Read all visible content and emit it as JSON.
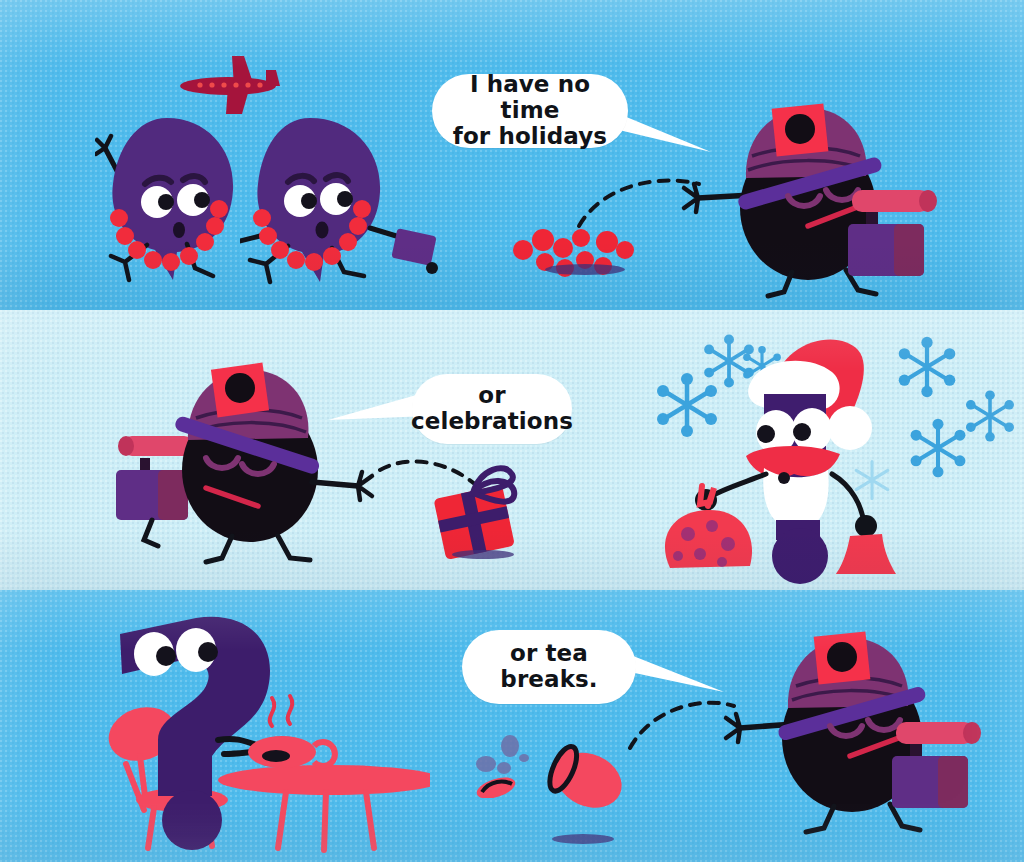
{
  "image": {
    "kind": "childrens-book-illustration",
    "title": "Grumpy traveller comic strip",
    "width": 1024,
    "height": 862,
    "panel_count": 3
  },
  "palette": {
    "sky_blue": "#4fbbec",
    "pale_blue": "#cdeef7",
    "purple": "#512a7e",
    "deep_purple": "#3d1d6b",
    "black_body": "#120d15",
    "red": "#ef2636",
    "pink_red": "#f4485f",
    "magenta_hat": "#7e3372",
    "violet_brim": "#5b2f9a",
    "white": "#ffffff",
    "snow_blue": "#3ba3dd"
  },
  "panels": [
    {
      "id": "panel-1",
      "name": "holidays",
      "background": "#4fbbec",
      "bubble": {
        "lines": [
          "I have no time",
          "for holidays"
        ],
        "tail_direction": "right"
      },
      "characters": [
        {
          "name": "tourist-left",
          "type": "purple-blob",
          "accessory": "flower-lei",
          "expression": "worried"
        },
        {
          "name": "tourist-right",
          "type": "purple-blob",
          "accessory": "flower-lei",
          "carrying": "suitcase",
          "expression": "surprised"
        },
        {
          "name": "traveller",
          "type": "black-blob",
          "hat": "purple-hat-with-red-patch",
          "eyes": "closed",
          "carrying": "suitcase-with-mat-roll"
        }
      ],
      "props": [
        {
          "name": "airplane",
          "color": "#a5143c"
        },
        {
          "name": "thrown-flower-lei",
          "color": "#ef2636"
        },
        {
          "name": "throw-arc",
          "style": "dashed"
        }
      ]
    },
    {
      "id": "panel-2",
      "name": "celebrations",
      "background": "#cdeef7",
      "bubble": {
        "lines": [
          "or",
          "celebrations"
        ],
        "tail_direction": "left"
      },
      "characters": [
        {
          "name": "traveller",
          "type": "black-blob",
          "hat": "purple-hat-with-red-patch",
          "eyes": "closed",
          "carrying": "suitcase-with-mat-roll",
          "facing": "right"
        },
        {
          "name": "santa",
          "type": "santa-claus",
          "hat": "red-santa-hat",
          "beard": "white",
          "moustache": "red",
          "holding": [
            "gift-sack",
            "hand-bell"
          ]
        }
      ],
      "props": [
        {
          "name": "thrown-gift-box",
          "color": "#ef2636",
          "ribbon": "#3d1d6b"
        },
        {
          "name": "throw-arc",
          "style": "dashed"
        },
        {
          "name": "snowflakes",
          "count": 7,
          "color": "#3ba3dd"
        }
      ]
    },
    {
      "id": "panel-3",
      "name": "tea-breaks",
      "background": "#4fbbec",
      "bubble": {
        "lines": [
          "or tea",
          "breaks."
        ],
        "tail_direction": "right"
      },
      "characters": [
        {
          "name": "question-mark-character",
          "type": "purple-question-mark",
          "eyes": "wide",
          "activity": "sitting-at-tea-table"
        },
        {
          "name": "traveller",
          "type": "black-blob",
          "hat": "purple-hat-with-red-patch",
          "eyes": "closed",
          "carrying": "suitcase-with-mat-roll"
        }
      ],
      "props": [
        {
          "name": "tea-table",
          "color": "#f4485f"
        },
        {
          "name": "teacup-with-steam",
          "color": "#f4485f"
        },
        {
          "name": "thrown-teacup",
          "color": "#f4485f"
        },
        {
          "name": "spilled-debris",
          "color": "#6d6fa8"
        },
        {
          "name": "throw-arc",
          "style": "dashed"
        }
      ]
    }
  ]
}
